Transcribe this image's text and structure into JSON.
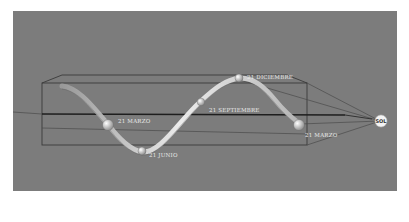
{
  "diagram": {
    "background_color": "#7c7c7c",
    "sun": {
      "label": "SOL"
    },
    "positions": [
      {
        "id": "march-start",
        "label": "21 MARZO"
      },
      {
        "id": "june",
        "label": "21 JUNIO"
      },
      {
        "id": "september",
        "label": "21 SEPTIEMBRE"
      },
      {
        "id": "december",
        "label": "21 DICIEMBRE"
      },
      {
        "id": "march-end",
        "label": "21 MARZO"
      }
    ]
  }
}
